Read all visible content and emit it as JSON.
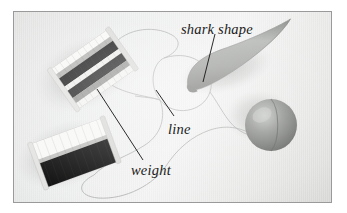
{
  "figure": {
    "kind": "annotated-photograph",
    "frame": {
      "border_color": "#9a9a9a",
      "page_background": "#ffffff"
    },
    "backdrop": {
      "base_color": "#ececea",
      "highlight_color": "#f4f5f4",
      "shade_color": "#dcdddb"
    },
    "labels": [
      {
        "id": "shark-shape",
        "text": "shark shape",
        "style": "italic-serif",
        "color": "#1b1b1b"
      },
      {
        "id": "line",
        "text": "line",
        "style": "italic-serif",
        "color": "#1b1b1b"
      },
      {
        "id": "weight",
        "text": "weight",
        "style": "italic-serif",
        "color": "#1b1b1b"
      }
    ],
    "leaders": [
      {
        "id": "leader-shark-shape",
        "from_label": "shark shape",
        "to_object": "shark-shape-body"
      },
      {
        "id": "leader-line",
        "from_label": "line",
        "to_object": "line-loop-center"
      },
      {
        "id": "leader-weight",
        "from_label": "weight",
        "to_object": "upper-spool"
      }
    ],
    "objects": [
      {
        "id": "upper-spool",
        "name": "upper thread spool weight",
        "description": "rectangular spool wound with white and black banded line, tilted diagonally",
        "colors": {
          "light_band": "#f6f6f4",
          "dark_band": "#1c1c1c",
          "mid_band": "#8d8d8d",
          "core": "#cfcfcd"
        }
      },
      {
        "id": "lower-spool",
        "name": "lower thread spool weight",
        "description": "rectangular spool with pale upper half and solid black lower half",
        "colors": {
          "light_band": "#f7f7f5",
          "dark_band": "#161616",
          "core": "#d6d6d4"
        }
      },
      {
        "id": "shark-shape-body",
        "name": "shark shape",
        "description": "elongated teardrop cone, blunt at lower-left tapering to a fine point at upper-right",
        "colors": {
          "body": "#9c9e9b",
          "shadow_side": "#6f716e",
          "highlight": "#c3c5c2"
        }
      },
      {
        "id": "sphere",
        "name": "round sinker",
        "description": "gray sphere with a vertical seam, cast shadow toward upper-left",
        "colors": {
          "body": "#8c8e8b",
          "highlight": "#b8bab7",
          "seam": "#6a6c69"
        }
      },
      {
        "id": "line-loop-center",
        "name": "monofilament line",
        "description": "thin translucent line looping in a large circle through the centre of the frame",
        "colors": {
          "stroke": "#a8aaa7"
        }
      }
    ]
  }
}
